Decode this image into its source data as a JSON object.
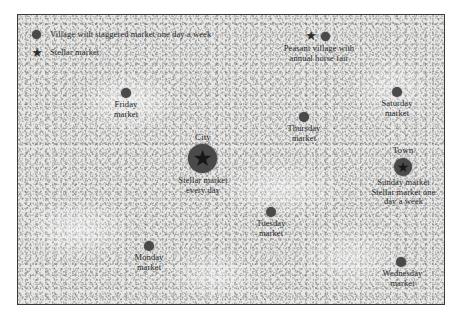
{
  "map": {
    "frame": {
      "border_color": "#3a3a3a",
      "background_color": "#e7e7e6"
    },
    "marker_color": "#4a4a4a",
    "text_color": "#1c1c1c"
  },
  "legend": {
    "items": [
      {
        "symbol": "circle",
        "label": "Village with staggered market one day a week"
      },
      {
        "symbol": "star",
        "label": "Stellar market"
      }
    ]
  },
  "places": [
    {
      "id": "peasant-village",
      "symbols": [
        "star",
        "circle"
      ],
      "name": "",
      "caption": "Peasant village with\nannual horse fair"
    },
    {
      "id": "friday-market",
      "symbols": [
        "circle"
      ],
      "name": "",
      "caption": "Friday\nmarket"
    },
    {
      "id": "saturday-market",
      "symbols": [
        "circle"
      ],
      "name": "",
      "caption": "Saturday\nmarket"
    },
    {
      "id": "thursday-market",
      "symbols": [
        "circle"
      ],
      "name": "",
      "caption": "Thursday\nmarket"
    },
    {
      "id": "city",
      "symbols": [
        "star-in-circle"
      ],
      "name": "City",
      "caption": "Stellar market\nevery day"
    },
    {
      "id": "town",
      "symbols": [
        "star-in-circle"
      ],
      "name": "Town",
      "caption": "Sunday market\nStellar market one\nday a week"
    },
    {
      "id": "tuesday-market",
      "symbols": [
        "circle"
      ],
      "name": "",
      "caption": "Tuesday\nmarket"
    },
    {
      "id": "monday-market",
      "symbols": [
        "circle"
      ],
      "name": "",
      "caption": "Monday\nmarket"
    },
    {
      "id": "wednesday-market",
      "symbols": [
        "circle"
      ],
      "name": "",
      "caption": "Wednesday\nmarket"
    }
  ],
  "glyphs": {
    "star": "★"
  }
}
